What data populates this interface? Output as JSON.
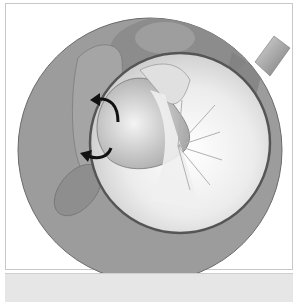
{
  "figure": {
    "colors": {
      "ring": "#9a9a9a",
      "ring_edge": "#6e6e6e",
      "lens_interior": "#f2f2f2",
      "arrow": "#111111",
      "frame_border": "#c8c8c8",
      "caption_strip": "#e6e6e6"
    },
    "arrows": [
      {
        "name": "upper-arrow",
        "direction": "counter-clockwise"
      },
      {
        "name": "lower-arrow",
        "direction": "counter-clockwise"
      }
    ]
  }
}
